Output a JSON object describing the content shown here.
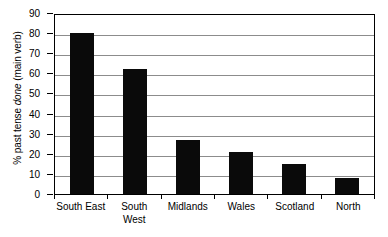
{
  "chart_data": {
    "type": "bar",
    "title": "",
    "xlabel": "",
    "ylabel": "% past tense done (main verb)",
    "ylabel_prefix": "% past tense ",
    "ylabel_italic": "done",
    "ylabel_suffix": " (main verb)",
    "categories": [
      "South East",
      "South West",
      "Midlands",
      "Wales",
      "Scotland",
      "North"
    ],
    "category_lines": [
      [
        "South East"
      ],
      [
        "South",
        "West"
      ],
      [
        "Midlands"
      ],
      [
        "Wales"
      ],
      [
        "Scotland"
      ],
      [
        "North"
      ]
    ],
    "values": [
      80,
      62,
      27,
      21,
      15,
      8
    ],
    "ylim": [
      0,
      90
    ],
    "ytick_step": 10,
    "yticks": [
      90,
      80,
      70,
      60,
      50,
      40,
      30,
      20,
      10,
      0
    ],
    "ytick_labels": [
      "90",
      "80",
      "70",
      "60",
      "50",
      "40",
      "30",
      "20",
      "10",
      "0"
    ],
    "grid": true,
    "grid_axis": "y",
    "legend": false,
    "legend_position": "none",
    "bar_color": "#0a0a0a",
    "grid_color": "#8c8c8c",
    "axis_color": "#000000",
    "background_color": "#ffffff"
  }
}
